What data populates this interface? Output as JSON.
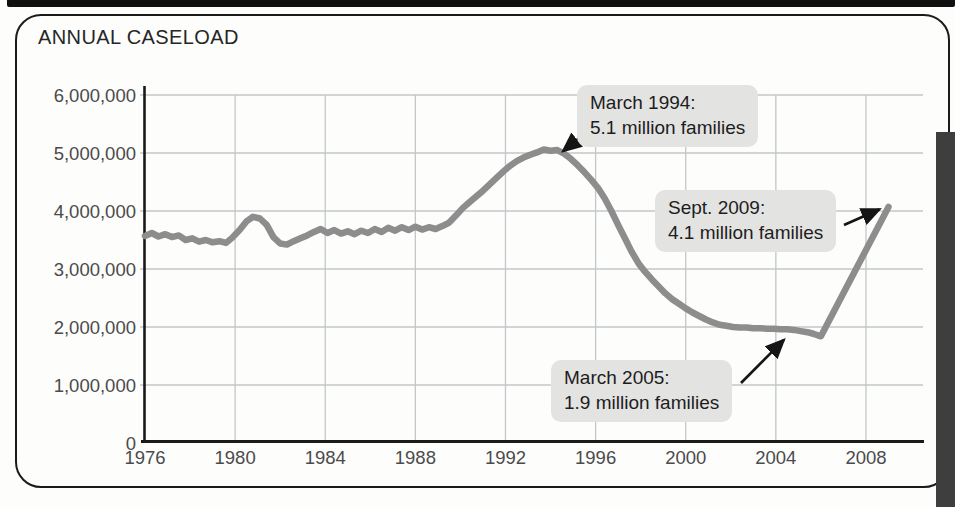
{
  "colors": {
    "line": "#8d8d8d",
    "grid": "#c3c7c9",
    "axis": "#1a1a1a",
    "tick_label": "#4b4b4b",
    "annotation_bg": "#e3e3e2",
    "arrow": "#151515",
    "edge_bar": "#3e3e3e"
  },
  "chart_data": {
    "type": "line",
    "title": "ANNUAL CASELOAD",
    "xlabel": "",
    "ylabel": "",
    "xlim": [
      1976,
      2010.5
    ],
    "ylim": [
      0,
      6000000
    ],
    "grid": true,
    "legend": "none",
    "xticks": [
      "1976",
      "1980",
      "1984",
      "1988",
      "1992",
      "1996",
      "2000",
      "2004",
      "2008"
    ],
    "yticks": [
      [
        0,
        "0"
      ],
      [
        1000000,
        "1,000,000"
      ],
      [
        2000000,
        "2,000,000"
      ],
      [
        3000000,
        "3,000,000"
      ],
      [
        4000000,
        "4,000,000"
      ],
      [
        5000000,
        "5,000,000"
      ],
      [
        6000000,
        "6,000,000"
      ]
    ],
    "points": [
      [
        1976.0,
        3570000
      ],
      [
        1976.3,
        3620000
      ],
      [
        1976.6,
        3560000
      ],
      [
        1976.9,
        3600000
      ],
      [
        1977.2,
        3550000
      ],
      [
        1977.5,
        3580000
      ],
      [
        1977.8,
        3500000
      ],
      [
        1978.1,
        3530000
      ],
      [
        1978.4,
        3470000
      ],
      [
        1978.7,
        3500000
      ],
      [
        1979.0,
        3460000
      ],
      [
        1979.3,
        3480000
      ],
      [
        1979.6,
        3450000
      ],
      [
        1979.9,
        3550000
      ],
      [
        1980.2,
        3670000
      ],
      [
        1980.5,
        3820000
      ],
      [
        1980.8,
        3900000
      ],
      [
        1981.1,
        3870000
      ],
      [
        1981.4,
        3760000
      ],
      [
        1981.7,
        3550000
      ],
      [
        1982.0,
        3440000
      ],
      [
        1982.3,
        3420000
      ],
      [
        1982.6,
        3480000
      ],
      [
        1982.9,
        3530000
      ],
      [
        1983.2,
        3580000
      ],
      [
        1983.5,
        3640000
      ],
      [
        1983.8,
        3690000
      ],
      [
        1984.1,
        3620000
      ],
      [
        1984.4,
        3670000
      ],
      [
        1984.7,
        3610000
      ],
      [
        1985.0,
        3650000
      ],
      [
        1985.3,
        3600000
      ],
      [
        1985.6,
        3660000
      ],
      [
        1985.9,
        3620000
      ],
      [
        1986.2,
        3690000
      ],
      [
        1986.5,
        3640000
      ],
      [
        1986.8,
        3710000
      ],
      [
        1987.1,
        3660000
      ],
      [
        1987.4,
        3720000
      ],
      [
        1987.7,
        3670000
      ],
      [
        1988.0,
        3730000
      ],
      [
        1988.3,
        3680000
      ],
      [
        1988.6,
        3720000
      ],
      [
        1988.9,
        3690000
      ],
      [
        1989.2,
        3740000
      ],
      [
        1989.5,
        3800000
      ],
      [
        1989.8,
        3920000
      ],
      [
        1990.1,
        4050000
      ],
      [
        1990.4,
        4150000
      ],
      [
        1990.7,
        4250000
      ],
      [
        1991.0,
        4350000
      ],
      [
        1991.3,
        4460000
      ],
      [
        1991.6,
        4570000
      ],
      [
        1991.9,
        4680000
      ],
      [
        1992.2,
        4780000
      ],
      [
        1992.5,
        4860000
      ],
      [
        1992.8,
        4920000
      ],
      [
        1993.1,
        4970000
      ],
      [
        1993.4,
        5010000
      ],
      [
        1993.7,
        5060000
      ],
      [
        1994.0,
        5040000
      ],
      [
        1994.3,
        5050000
      ],
      [
        1994.6,
        4990000
      ],
      [
        1994.9,
        4900000
      ],
      [
        1995.2,
        4790000
      ],
      [
        1995.5,
        4670000
      ],
      [
        1995.8,
        4540000
      ],
      [
        1996.1,
        4400000
      ],
      [
        1996.4,
        4220000
      ],
      [
        1996.7,
        4000000
      ],
      [
        1997.0,
        3760000
      ],
      [
        1997.3,
        3530000
      ],
      [
        1997.6,
        3300000
      ],
      [
        1997.9,
        3100000
      ],
      [
        1998.2,
        2950000
      ],
      [
        1998.5,
        2820000
      ],
      [
        1998.8,
        2700000
      ],
      [
        1999.1,
        2580000
      ],
      [
        1999.4,
        2480000
      ],
      [
        1999.7,
        2400000
      ],
      [
        2000.0,
        2320000
      ],
      [
        2000.3,
        2250000
      ],
      [
        2000.6,
        2190000
      ],
      [
        2000.9,
        2130000
      ],
      [
        2001.2,
        2080000
      ],
      [
        2001.5,
        2040000
      ],
      [
        2001.8,
        2020000
      ],
      [
        2002.1,
        2000000
      ],
      [
        2002.4,
        1990000
      ],
      [
        2002.7,
        1990000
      ],
      [
        2003.0,
        1980000
      ],
      [
        2003.3,
        1980000
      ],
      [
        2003.6,
        1970000
      ],
      [
        2003.9,
        1970000
      ],
      [
        2004.2,
        1960000
      ],
      [
        2004.5,
        1960000
      ],
      [
        2004.8,
        1950000
      ],
      [
        2005.1,
        1930000
      ],
      [
        2005.4,
        1910000
      ],
      [
        2005.7,
        1880000
      ],
      [
        2006.0,
        1840000
      ],
      [
        2009.0,
        4070000
      ]
    ],
    "annotations": [
      {
        "line1": "March 1994:",
        "line2": "5.1 million families",
        "year": 1994.2,
        "value": 5100000
      },
      {
        "line1": "Sept. 2009:",
        "line2": "4.1 million families",
        "year": 2009.0,
        "value": 4100000
      },
      {
        "line1": "March 2005:",
        "line2": "1.9 million families",
        "year": 2005.2,
        "value": 1900000
      }
    ]
  }
}
